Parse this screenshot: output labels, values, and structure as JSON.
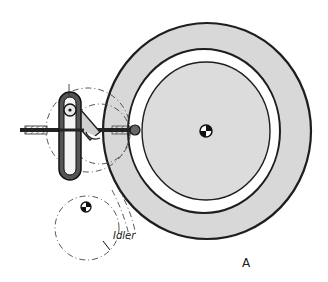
{
  "figure": {
    "labels": {
      "idler": "Idler",
      "view": "A"
    },
    "components": [
      {
        "name": "turntable-disc",
        "description": "Large shaded platter with white rim band"
      },
      {
        "name": "center-spindle",
        "description": "Quartered center mark of turntable"
      },
      {
        "name": "idler-wheel",
        "description": "Dash-dot idler wheel with center mark"
      },
      {
        "name": "slotted-link",
        "description": "Vertical slotted link with pivot"
      },
      {
        "name": "drive-rod",
        "description": "Horizontal rod with ball end contacting the platter"
      }
    ],
    "colors": {
      "ink": "#1e1e1e",
      "shade": "#d8d8d8",
      "band": "#ffffff"
    }
  }
}
